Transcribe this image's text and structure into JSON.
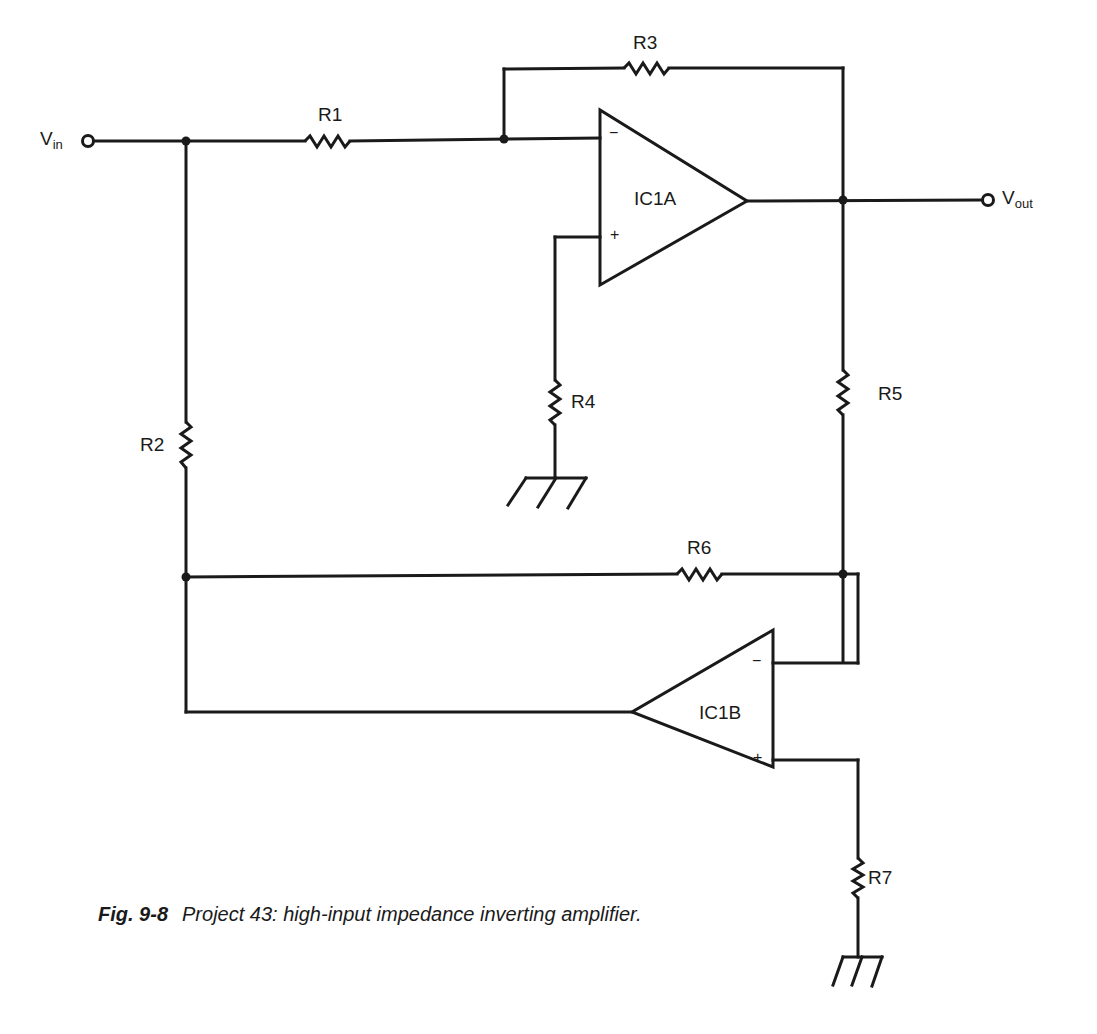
{
  "diagram": {
    "type": "circuit-schematic",
    "terminals": {
      "input": {
        "label": "V",
        "sub": "in"
      },
      "output": {
        "label": "V",
        "sub": "out"
      }
    },
    "opamps": [
      {
        "id": "IC1A",
        "label": "IC1A",
        "minus": "−",
        "plus": "+"
      },
      {
        "id": "IC1B",
        "label": "IC1B",
        "minus": "−",
        "plus": "+"
      }
    ],
    "resistors": [
      {
        "id": "R1",
        "label": "R1"
      },
      {
        "id": "R2",
        "label": "R2"
      },
      {
        "id": "R3",
        "label": "R3"
      },
      {
        "id": "R4",
        "label": "R4"
      },
      {
        "id": "R5",
        "label": "R5"
      },
      {
        "id": "R6",
        "label": "R6"
      },
      {
        "id": "R7",
        "label": "R7"
      }
    ],
    "grounds": [
      "R4-ground",
      "R7-ground"
    ],
    "colors": {
      "ink": "#1a1a1a",
      "background": "#ffffff"
    }
  },
  "caption": {
    "figure": "Fig. 9-8",
    "text": "Project 43: high-input impedance inverting amplifier."
  }
}
